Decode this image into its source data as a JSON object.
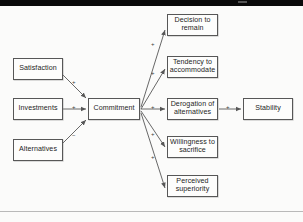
{
  "page": {
    "background_color": "#fbfbfa",
    "scan_bar_color": "#0a0a0a",
    "line_color": "#575757"
  },
  "diagram": {
    "type": "flowchart",
    "nodes": [
      {
        "id": "satisfaction",
        "label": "Satisfaction",
        "x": 13,
        "y": 52,
        "w": 50,
        "h": 22
      },
      {
        "id": "investments",
        "label": "Investments",
        "x": 13,
        "y": 92,
        "w": 50,
        "h": 22
      },
      {
        "id": "alternatives",
        "label": "Alternatives",
        "x": 13,
        "y": 133,
        "w": 50,
        "h": 22
      },
      {
        "id": "commitment",
        "label": "Commitment",
        "x": 88,
        "y": 92,
        "w": 52,
        "h": 22
      },
      {
        "id": "decision",
        "label": "Decision to remain",
        "x": 167,
        "y": 8,
        "w": 51,
        "h": 22
      },
      {
        "id": "tendency",
        "label": "Tendency to accommodate",
        "x": 167,
        "y": 50,
        "w": 51,
        "h": 22
      },
      {
        "id": "derogation",
        "label": "Derogation of alternatives",
        "x": 167,
        "y": 92,
        "w": 51,
        "h": 22
      },
      {
        "id": "willingness",
        "label": "Willingness to sacrifice",
        "x": 167,
        "y": 130,
        "w": 51,
        "h": 22
      },
      {
        "id": "perceived",
        "label": "Perceived superiority",
        "x": 167,
        "y": 169,
        "w": 51,
        "h": 22
      },
      {
        "id": "stability",
        "label": "Stability",
        "x": 243,
        "y": 92,
        "w": 50,
        "h": 22
      }
    ],
    "edges": [
      {
        "from": "satisfaction",
        "to": "commitment",
        "sign": "+",
        "sign_x": 72,
        "sign_y": 73
      },
      {
        "from": "investments",
        "to": "commitment",
        "sign": "+",
        "sign_x": 72,
        "sign_y": 98
      },
      {
        "from": "alternatives",
        "to": "commitment",
        "sign": "−",
        "sign_x": 72,
        "sign_y": 126
      },
      {
        "from": "commitment",
        "to": "decision",
        "sign": "+",
        "sign_x": 151,
        "sign_y": 35
      },
      {
        "from": "commitment",
        "to": "tendency",
        "sign": "+",
        "sign_x": 151,
        "sign_y": 64
      },
      {
        "from": "commitment",
        "to": "derogation",
        "sign": "+",
        "sign_x": 151,
        "sign_y": 98
      },
      {
        "from": "commitment",
        "to": "willingness",
        "sign": "+",
        "sign_x": 151,
        "sign_y": 125
      },
      {
        "from": "commitment",
        "to": "perceived",
        "sign": "+",
        "sign_x": 151,
        "sign_y": 148
      },
      {
        "from": "derogation",
        "to": "stability",
        "sign": "+",
        "sign_x": 226,
        "sign_y": 98
      }
    ]
  }
}
